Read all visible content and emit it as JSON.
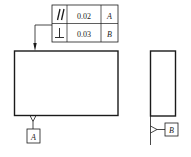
{
  "feature_control_frame": {
    "rows": [
      {
        "symbol": "//",
        "symbol_name": "parallelism-icon",
        "tolerance": "0.02",
        "datum": "A"
      },
      {
        "symbol": "⊥",
        "symbol_name": "perpendicularity-icon",
        "tolerance": "0.03",
        "datum": "B"
      }
    ]
  },
  "datums": {
    "front_view": {
      "label": "A"
    },
    "side_view": {
      "label": "B"
    }
  },
  "colors": {
    "line": "#1a1a1a",
    "background": "#ffffff"
  }
}
